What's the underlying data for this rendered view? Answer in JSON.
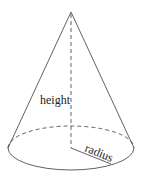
{
  "diagram": {
    "type": "cone",
    "labels": {
      "height": "height",
      "radius": "radius"
    },
    "colors": {
      "stroke": "#3a3a3a",
      "background": "#ffffff",
      "text": "#222222"
    },
    "geometry": {
      "apex": [
        71,
        12
      ],
      "base_center": [
        71,
        148
      ],
      "base_rx": 63,
      "base_ry": 22,
      "radius_end": [
        111,
        164
      ]
    }
  }
}
